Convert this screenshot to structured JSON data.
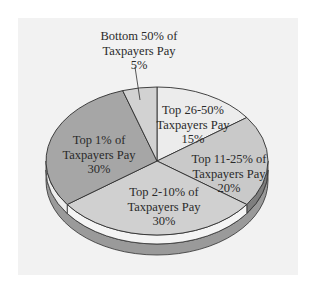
{
  "chart_data": {
    "type": "pie",
    "title": "",
    "style": "3d-exploded-none",
    "start_angle_deg": -90,
    "direction": "clockwise",
    "slices": [
      {
        "label": "Top 26-50% of Taxpayers Pay",
        "lines": [
          "Top 26-50%",
          "Taxpayers Pay",
          "15%"
        ],
        "value": 15,
        "color": "#ececec",
        "side": "#dcdcdc"
      },
      {
        "label": "Top 11-25% of Taxpayers Pay",
        "lines": [
          "Top 11-25% of",
          "Taxpayers Pay",
          "20%"
        ],
        "value": 20,
        "color": "#c9c9c9",
        "side": "#7e7e7e"
      },
      {
        "label": "Top 2-10% of Taxpayers Pay",
        "lines": [
          "Top 2-10% of",
          "Taxpayers Pay",
          "30%"
        ],
        "value": 30,
        "color": "#d0d0d0",
        "side": "#f4f4f4"
      },
      {
        "label": "Top 1% of Taxpayers Pay",
        "lines": [
          "Top 1% of",
          "Taxpayers Pay",
          "30%"
        ],
        "value": 30,
        "color": "#a6a6a6",
        "side": "#ededed"
      },
      {
        "label": "Bottom 50% of Taxpayers Pay",
        "lines": [
          "Bottom 50% of",
          "Taxpayers Pay",
          "5%"
        ],
        "value": 5,
        "color": "#d2d2d2",
        "side": "#d2d2d2"
      }
    ],
    "label_positions": [
      {
        "x": 193,
        "y": 114
      },
      {
        "x": 229,
        "y": 163
      },
      {
        "x": 164,
        "y": 196
      },
      {
        "x": 99,
        "y": 144
      },
      {
        "x": 139,
        "y": 40
      }
    ],
    "leader_line": {
      "slice": 4,
      "from": [
        135,
        67
      ],
      "to": [
        140,
        100
      ]
    },
    "geometry": {
      "cx": 157,
      "cy": 161,
      "rx": 111,
      "ry": 74,
      "side_depth": 9,
      "base_depth": 11
    },
    "colors": {
      "background": "#ffffff",
      "panel": "#f2f2f2",
      "stroke": "#2f2f2f",
      "base": "#9a9a9a"
    }
  }
}
